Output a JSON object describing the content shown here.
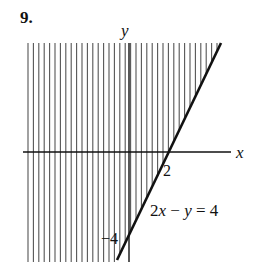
{
  "problem": {
    "number": "9."
  },
  "axes": {
    "x_label": "x",
    "y_label": "y"
  },
  "line": {
    "equation_parts": [
      "2",
      "x",
      " − ",
      "y",
      " = 4"
    ],
    "equation": "2x − y = 4",
    "x_intercept_label": "2",
    "y_intercept_label": "−4",
    "color": "#111111"
  },
  "shading": {
    "style": "vertical-hatch",
    "region": "2x − y ≤ 4 (left/above the line)",
    "color": "#555555"
  },
  "chart_data": {
    "type": "line",
    "title": "9.",
    "xlabel": "x",
    "ylabel": "y",
    "series": [
      {
        "name": "2x − y = 4",
        "x": [
          -0.75,
          5.6
        ],
        "y": [
          -5,
          5
        ]
      }
    ],
    "intercepts": {
      "x": 2,
      "y": -4
    },
    "shaded_region": "2x − y ≤ 4",
    "annotations": [
      "2",
      "−4",
      "2x − y = 4"
    ],
    "grid": false
  }
}
